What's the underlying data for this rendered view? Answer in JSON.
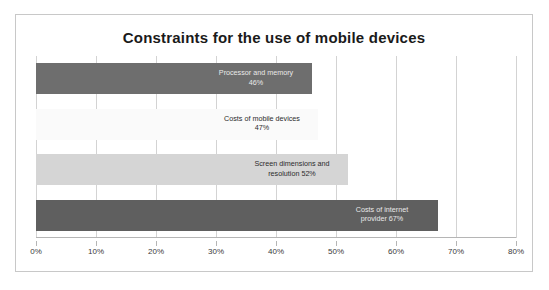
{
  "chart_data": {
    "type": "bar",
    "orientation": "horizontal",
    "title": "Constraints for the use of mobile devices",
    "xlabel": "",
    "ylabel": "",
    "xlim": [
      0,
      80
    ],
    "xtick_labels": [
      "0%",
      "10%",
      "20%",
      "30%",
      "40%",
      "50%",
      "60%",
      "70%",
      "80%"
    ],
    "xtick_values": [
      0,
      10,
      20,
      30,
      40,
      50,
      60,
      70,
      80
    ],
    "grid": "vertical",
    "legend": "none",
    "categories": [
      "Processor and memory",
      "Costs of mobile devices",
      "Screen dimensions and resolution",
      "Costs of internet provider"
    ],
    "values": [
      46,
      47,
      52,
      67
    ],
    "value_labels": [
      "46%",
      "47%",
      "52%",
      "67%"
    ],
    "bars": [
      {
        "category": "Processor and memory",
        "value": 46,
        "value_label": "46%",
        "label_line1": "Processor and memory",
        "label_line2": "46%",
        "color": "#6e6e6e",
        "label_tone": "ondark"
      },
      {
        "category": "Costs of mobile devices",
        "value": 47,
        "value_label": "47%",
        "label_line1": "Costs of mobile devices",
        "label_line2": "47%",
        "color": "#fafafa",
        "label_tone": "onlight"
      },
      {
        "category": "Screen dimensions and resolution",
        "value": 52,
        "value_label": "52%",
        "label_line1": "Screen dimensions and",
        "label_line2": "resolution 52%",
        "color": "#d5d5d5",
        "label_tone": "onlight"
      },
      {
        "category": "Costs of internet provider",
        "value": 67,
        "value_label": "67%",
        "label_line1": "Costs of internet",
        "label_line2": "provider  67%",
        "color": "#5f5f5f",
        "label_tone": "ondark"
      }
    ],
    "colors": {
      "grid": "#d3d3d3",
      "axis": "#b5b5b5",
      "border": "#c8c8c8",
      "background": "#ffffff",
      "title_text": "#1a1a1a"
    }
  }
}
